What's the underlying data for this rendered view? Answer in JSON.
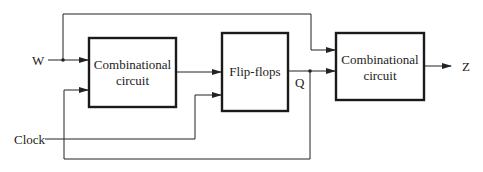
{
  "diagram": {
    "type": "sequential-circuit-block-diagram",
    "inputs": {
      "w_label": "W",
      "clock_label": "Clock"
    },
    "outputs": {
      "z_label": "Z",
      "q_label": "Q"
    },
    "blocks": [
      {
        "id": "comb1",
        "line1": "Combinational",
        "line2": "circuit"
      },
      {
        "id": "ff",
        "line1": "Flip-flops"
      },
      {
        "id": "comb2",
        "line1": "Combinational",
        "line2": "circuit"
      }
    ],
    "connections": [
      {
        "from": "W",
        "to": "comb1"
      },
      {
        "from": "W",
        "to": "comb2"
      },
      {
        "from": "comb1",
        "to": "ff"
      },
      {
        "from": "Clock",
        "to": "ff"
      },
      {
        "from": "ff",
        "to": "comb2",
        "label": "Q"
      },
      {
        "from": "Q",
        "to": "comb1",
        "note": "feedback"
      },
      {
        "from": "comb2",
        "to": "Z"
      }
    ],
    "colors": {
      "line": "#222222",
      "background": "#ffffff"
    }
  }
}
